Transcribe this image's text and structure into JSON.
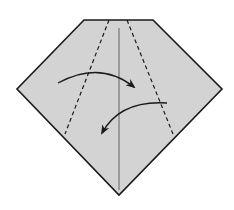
{
  "diagram": {
    "type": "origami-fold-step",
    "colors": {
      "paper": "#d3d3d3",
      "outline": "#1a1a1a",
      "crease": "#555555",
      "background": "#ffffff"
    },
    "paper_outline": [
      [
        84,
        20
      ],
      [
        153,
        20
      ],
      [
        222,
        89
      ],
      [
        119,
        195
      ],
      [
        17,
        89
      ]
    ],
    "center_crease": {
      "x1": 119,
      "y1": 28,
      "x2": 119,
      "y2": 190
    },
    "valley_fold_lines": [
      {
        "name": "left-fold-line",
        "x1": 109,
        "y1": 20,
        "x2": 65,
        "y2": 134
      },
      {
        "name": "right-fold-line",
        "x1": 127,
        "y1": 20,
        "x2": 173,
        "y2": 134
      }
    ],
    "fold_arrows": [
      {
        "name": "fold-left-flap-right",
        "path": "M58,83 Q100,60 134,87",
        "tip": [
          134,
          87
        ]
      },
      {
        "name": "fold-right-flap-left",
        "path": "M167,103 Q120,100 102,133",
        "tip": [
          102,
          133
        ]
      }
    ]
  }
}
